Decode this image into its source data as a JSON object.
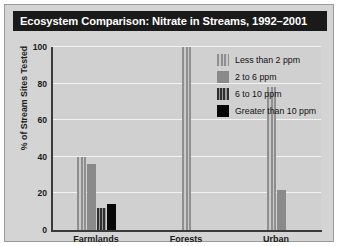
{
  "chart_data": {
    "type": "bar",
    "title": "Ecosystem Comparison: Nitrate in Streams, 1992–2001",
    "xlabel": "",
    "ylabel": "% of Stream Sites Tested",
    "categories": [
      "Farmlands",
      "Forests",
      "Urban"
    ],
    "ylim": [
      0,
      100
    ],
    "yticks": [
      0,
      20,
      40,
      60,
      80,
      100
    ],
    "ytick_labels": [
      "0",
      "20",
      "40",
      "60",
      "80",
      "100"
    ],
    "grid": true,
    "legend_position": "top-right",
    "series": [
      {
        "name": "Less than 2 ppm",
        "pattern": "pat-light",
        "values": [
          40,
          100,
          78
        ]
      },
      {
        "name": "2 to 6 ppm",
        "pattern": "pat-solidgray",
        "values": [
          36,
          0,
          22
        ]
      },
      {
        "name": "6 to 10 ppm",
        "pattern": "pat-dark",
        "values": [
          12,
          0,
          0
        ]
      },
      {
        "name": "Greater than 10 ppm",
        "pattern": "pat-black",
        "values": [
          14,
          0,
          0
        ]
      }
    ]
  }
}
